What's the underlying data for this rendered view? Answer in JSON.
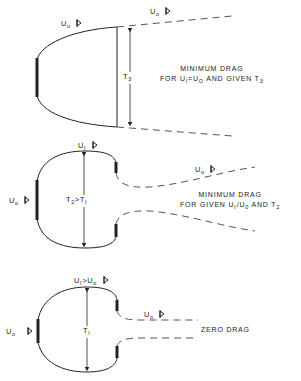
{
  "diagrams": [
    {
      "id": "minimum-drag-given-T3",
      "labels": {
        "outer_top": {
          "symbol": "U",
          "sub": "o"
        },
        "outer_far": {
          "symbol": "U",
          "sub": "o"
        },
        "thickness": {
          "symbol": "T",
          "sub": "3"
        }
      },
      "caption": {
        "line1": "MINIMUM DRAG",
        "line2_pre": "FOR U",
        "line2_sub1": "I",
        "line2_mid": "=U",
        "line2_sub2": "O",
        "line2_post": " AND GIVEN T",
        "line2_sub3": "3"
      }
    },
    {
      "id": "minimum-drag-given-U1-U0-T2",
      "labels": {
        "inner_top": {
          "symbol": "U",
          "sub": "I"
        },
        "front": {
          "symbol": "U",
          "sub": "o"
        },
        "wake": {
          "symbol": "U",
          "sub": "o"
        },
        "thickness": {
          "symbol": "T",
          "sub": "2",
          "relation": ">T",
          "sub2": "I"
        }
      },
      "caption": {
        "line1": "MINIMUM DRAG",
        "line2_pre": "FOR  GIVEN U",
        "line2_sub1": "I",
        "line2_mid": "/U",
        "line2_sub2": "0",
        "line2_post": " AND T",
        "line2_sub3": "2"
      }
    },
    {
      "id": "zero-drag",
      "labels": {
        "inner_top": {
          "symbol": "U",
          "sub": "I",
          "relation": ">U",
          "sub2": "o"
        },
        "front": {
          "symbol": "U",
          "sub": "o"
        },
        "wake": {
          "symbol": "U",
          "sub": "o"
        },
        "thickness": {
          "symbol": "T",
          "sub": "I"
        }
      },
      "caption": {
        "line1": "ZERO  DRAG"
      }
    }
  ],
  "icons": {
    "flow_arrow": "flow-direction-arrow-icon"
  },
  "colors": {
    "line": "#222222",
    "dash": "#555555",
    "background": "#ffffff"
  }
}
